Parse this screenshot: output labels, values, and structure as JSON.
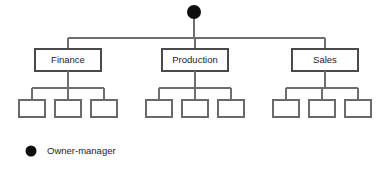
{
  "diagram": {
    "type": "organizational-chart",
    "title": "",
    "canvas": {
      "width": 387,
      "height": 176,
      "background": "#ffffff"
    },
    "colors": {
      "node_fill": "#0d0d0d",
      "box_stroke": "#4a4a4a",
      "connector_stroke": "#6e6e6e",
      "box_fill": "#ffffff",
      "text": "#1c1c1c"
    },
    "root": {
      "shape": "circle",
      "label": "",
      "cx": 194,
      "cy": 12,
      "r": 7
    },
    "connector_y": 38,
    "departments": [
      {
        "label": "Finance",
        "box": {
          "x": 35,
          "y": 49,
          "w": 66,
          "h": 22
        },
        "center_x": 68,
        "children": [
          {
            "label": "",
            "x": 19,
            "y": 100,
            "w": 26,
            "h": 17
          },
          {
            "label": "",
            "x": 55,
            "y": 100,
            "w": 26,
            "h": 17
          },
          {
            "label": "",
            "x": 91,
            "y": 100,
            "w": 26,
            "h": 17
          }
        ]
      },
      {
        "label": "Production",
        "box": {
          "x": 162,
          "y": 49,
          "w": 66,
          "h": 22
        },
        "center_x": 195,
        "children": [
          {
            "label": "",
            "x": 146,
            "y": 100,
            "w": 26,
            "h": 17
          },
          {
            "label": "",
            "x": 182,
            "y": 100,
            "w": 26,
            "h": 17
          },
          {
            "label": "",
            "x": 218,
            "y": 100,
            "w": 26,
            "h": 17
          }
        ]
      },
      {
        "label": "Sales",
        "box": {
          "x": 292,
          "y": 49,
          "w": 66,
          "h": 22
        },
        "center_x": 325,
        "children": [
          {
            "label": "",
            "x": 273,
            "y": 100,
            "w": 26,
            "h": 17
          },
          {
            "label": "",
            "x": 309,
            "y": 100,
            "w": 26,
            "h": 17
          },
          {
            "label": "",
            "x": 345,
            "y": 100,
            "w": 26,
            "h": 17
          }
        ]
      }
    ],
    "sub_connector_y": 88,
    "legend": {
      "marker": {
        "shape": "circle",
        "cx": 31,
        "cy": 151,
        "r": 5.5,
        "color": "#0d0d0d"
      },
      "label": "Owner-manager",
      "label_x": 47,
      "label_y": 151
    }
  }
}
